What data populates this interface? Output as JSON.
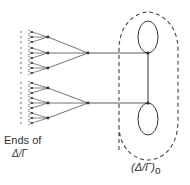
{
  "diagram": {
    "left_label_line1": "Ends of",
    "left_label_line2": "Δ/Γ",
    "right_label": "(Δ/Γ)",
    "right_label_subscript": "o",
    "colors": {
      "stroke": "#333333",
      "dashed": "#444444"
    },
    "nodes": {
      "upper_root": [
        88,
        53
      ],
      "lower_root": [
        88,
        103
      ],
      "upper_vertex": [
        148,
        53
      ],
      "lower_vertex": [
        148,
        103
      ]
    },
    "loops": [
      {
        "cx": 148,
        "cy": 37,
        "rx": 10,
        "ry": 16
      },
      {
        "cx": 148,
        "cy": 119,
        "rx": 10,
        "ry": 16
      }
    ],
    "trees": [
      {
        "root": [
          88,
          53
        ],
        "subnodes": [
          [
            48,
            37
          ],
          [
            48,
            53
          ],
          [
            48,
            68
          ]
        ]
      },
      {
        "root": [
          88,
          103
        ],
        "subnodes": [
          [
            48,
            88
          ],
          [
            48,
            103
          ],
          [
            48,
            118
          ]
        ]
      }
    ]
  }
}
